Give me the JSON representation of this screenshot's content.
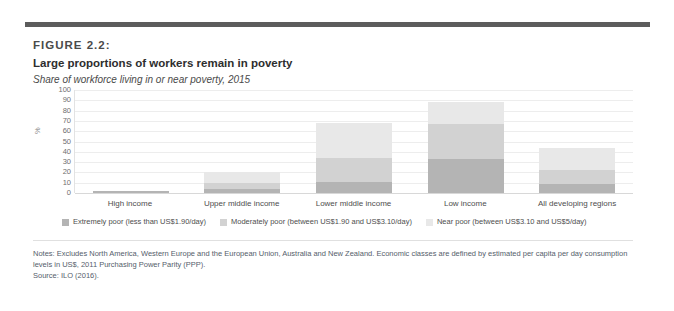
{
  "figure": {
    "number": "FIGURE 2.2:",
    "title": "Large proportions of workers remain in poverty",
    "subtitle": "Share of workforce living in or near poverty, 2015"
  },
  "notes": {
    "body": "Notes: Excludes North America, Western Europe and the European Union, Australia and New Zealand. Economic classes are defined by estimated per capita per day consumption levels in US$, 2011 Purchasing Power Parity (PPP).",
    "source": "Source: ILO (2016)."
  },
  "colors": {
    "extremely_poor": "#b4b4b4",
    "moderately_poor": "#d2d2d2",
    "near_poor": "#e8e8e8",
    "top_rule": "#5c5c5c",
    "gridline": "#ededed",
    "axis": "#d8d8d8"
  },
  "chart_data": {
    "type": "bar",
    "title": "Large proportions of workers remain in poverty",
    "subtitle": "Share of workforce living in or near poverty, 2015",
    "xlabel": "",
    "ylabel": "%",
    "ylim": [
      0,
      100
    ],
    "yticks": [
      100,
      90,
      80,
      70,
      60,
      50,
      40,
      30,
      20,
      10,
      0
    ],
    "grid": true,
    "stacked": true,
    "legend_position": "bottom",
    "categories": [
      "High income",
      "Upper middle income",
      "Lower middle income",
      "Low income",
      "All developing regions"
    ],
    "series": [
      {
        "name": "Extremely poor (less than US$1.90/day)",
        "color": "#b4b4b4",
        "values": [
          2,
          4,
          11,
          33,
          9
        ]
      },
      {
        "name": "Moderately poor (between US$1.90 and US$3.10/day)",
        "color": "#d2d2d2",
        "values": [
          0,
          6,
          23,
          34,
          13
        ]
      },
      {
        "name": "Near poor (between US$3.10 and US$5/day)",
        "color": "#e8e8e8",
        "values": [
          0,
          10,
          34,
          21,
          22
        ]
      }
    ],
    "totals": [
      2,
      20,
      68,
      88,
      44
    ]
  }
}
